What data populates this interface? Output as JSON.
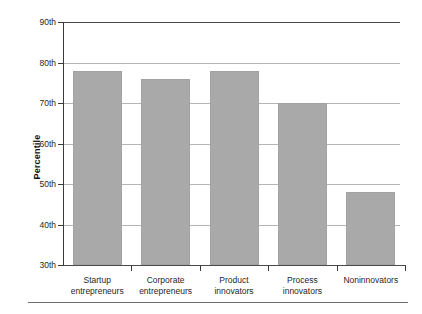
{
  "chart_data": {
    "type": "bar",
    "title": "",
    "xlabel": "",
    "ylabel": "Percentile",
    "categories": [
      "Startup entrepreneurs",
      "Corporate entrepreneurs",
      "Product innovators",
      "Process innovators",
      "Noninnovators"
    ],
    "values": [
      78,
      76,
      78,
      70,
      48
    ],
    "ylim": [
      30,
      90
    ],
    "ytick_values": [
      30,
      40,
      50,
      60,
      70,
      80,
      90
    ],
    "ytick_labels": [
      "30th",
      "40th",
      "50th",
      "60th",
      "70th",
      "80th",
      "90th"
    ],
    "grid": true,
    "legend": false,
    "bar_color": "#a9a9a9",
    "axis_color": "#3a3a3a",
    "gridline_color": "#b4b4b4"
  },
  "axes": {
    "y_title": "Percentile",
    "ticks": [
      {
        "label": "90th",
        "value": 90
      },
      {
        "label": "80th",
        "value": 80
      },
      {
        "label": "70th",
        "value": 70
      },
      {
        "label": "60th",
        "value": 60
      },
      {
        "label": "50th",
        "value": 50
      },
      {
        "label": "40th",
        "value": 40
      },
      {
        "label": "30th",
        "value": 30
      }
    ]
  },
  "bars": [
    {
      "label_line1": "Startup",
      "label_line2": "entrepreneurs",
      "value": 78
    },
    {
      "label_line1": "Corporate",
      "label_line2": "entrepreneurs",
      "value": 76
    },
    {
      "label_line1": "Product",
      "label_line2": "innovators",
      "value": 78
    },
    {
      "label_line1": "Process",
      "label_line2": "innovators",
      "value": 70
    },
    {
      "label_line1": "Noninnovators",
      "label_line2": "",
      "value": 48
    }
  ]
}
